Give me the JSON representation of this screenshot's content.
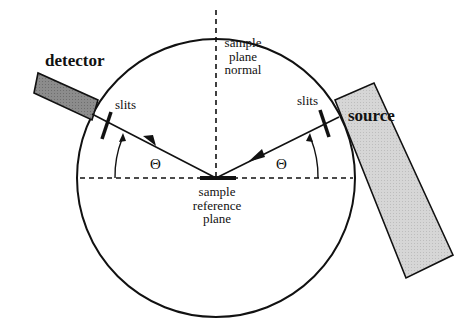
{
  "diagram": {
    "labels": {
      "detector": "detector",
      "source": "source",
      "slits_left": "slits",
      "slits_right": "slits",
      "sample_plane_normal": "sample plane normal",
      "sample_reference_plane": "sample reference plane",
      "theta_left": "Θ",
      "theta_right": "Θ"
    },
    "colors": {
      "line": "#111111",
      "detector_fill": "#8a8a8a",
      "source_fill": "#d9d9d9",
      "background": "#ffffff"
    },
    "geometry": {
      "circle_center": [
        216,
        178
      ],
      "circle_radius": 139,
      "incident_angle_deg": 22
    }
  }
}
